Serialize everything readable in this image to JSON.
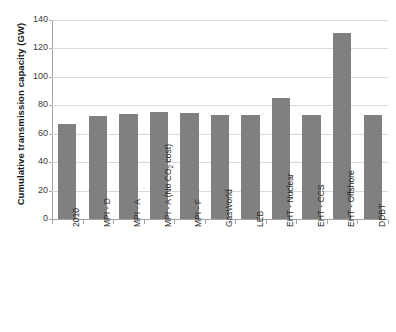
{
  "chart_data": {
    "type": "bar",
    "title": "",
    "xlabel": "",
    "ylabel": "Cumulative transmission capacity (GW)",
    "ylim": [
      0,
      140
    ],
    "ytick_step": 20,
    "yticks": [
      0,
      20,
      40,
      60,
      80,
      100,
      120,
      140
    ],
    "ytick_labels": [
      "0",
      "20",
      "40",
      "60",
      "80",
      "100",
      "120",
      "140"
    ],
    "grid": true,
    "legend": false,
    "legend_position": "none",
    "bar_color": "#808080",
    "categories": [
      "2010",
      "MPI - D",
      "MPI - A",
      "MPI - A (No CO2 cost)",
      "MPI - F",
      "GasWorld",
      "LEB",
      "EHT - Nuclear",
      "EHT - CCS",
      "EHT - Offshore",
      "DDBT"
    ],
    "values": [
      67,
      72.5,
      74,
      75,
      74.5,
      73.5,
      73.5,
      85,
      73,
      131,
      73.5
    ]
  },
  "axis": {
    "y_title": "Cumulative transmission capacity (GW)"
  },
  "x_labels": [
    {
      "prefix": "2010",
      "sub": "",
      "suffix": ""
    },
    {
      "prefix": "MPI - D",
      "sub": "",
      "suffix": ""
    },
    {
      "prefix": "MPI - A",
      "sub": "",
      "suffix": ""
    },
    {
      "prefix": "MPI - A (No CO",
      "sub": "2",
      "suffix": " cost)"
    },
    {
      "prefix": "MPI - F",
      "sub": "",
      "suffix": ""
    },
    {
      "prefix": "GasWorld",
      "sub": "",
      "suffix": ""
    },
    {
      "prefix": "LEB",
      "sub": "",
      "suffix": ""
    },
    {
      "prefix": "EHT - Nuclear",
      "sub": "",
      "suffix": ""
    },
    {
      "prefix": "EHT - CCS",
      "sub": "",
      "suffix": ""
    },
    {
      "prefix": "EHT - Offshore",
      "sub": "",
      "suffix": ""
    },
    {
      "prefix": "DDBT",
      "sub": "",
      "suffix": ""
    }
  ],
  "colors": {
    "bar": "#808080",
    "gridline": "#d9d9d9",
    "axis": "#a6a6a6",
    "text": "#2b2b2b",
    "background": "#ffffff"
  }
}
